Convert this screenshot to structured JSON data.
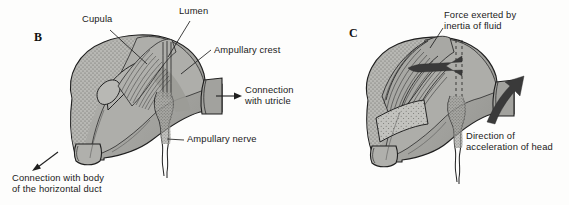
{
  "figure": {
    "background_color": "#fdfdfc",
    "ink_color": "#1a1a1a",
    "tissue_fill": "#a8a8a4",
    "tissue_fill_light": "#bdbdb9",
    "tissue_fill_dark": "#8f8f8b",
    "arrow_color": "#3a3a3a"
  },
  "panels": [
    {
      "id": "B",
      "letter": "B",
      "letter_pos": {
        "x": 36,
        "y": 35
      },
      "labels": [
        {
          "name": "cupula",
          "text": "Cupula",
          "x": 82,
          "y": 17,
          "lines": [
            "Cupula"
          ],
          "leader": {
            "x1": 108,
            "y1": 30,
            "x2": 146,
            "y2": 63
          }
        },
        {
          "name": "lumen",
          "text": "Lumen",
          "x": 180,
          "y": 8,
          "lines": [
            "Lumen"
          ],
          "leader": {
            "x1": 188,
            "y1": 21,
            "x2": 168,
            "y2": 58
          }
        },
        {
          "name": "ampullary-crest",
          "text": "Ampullary crest",
          "x": 213,
          "y": 44,
          "lines": [
            "Ampullary crest"
          ],
          "leader": {
            "x1": 211,
            "y1": 50,
            "x2": 180,
            "y2": 75
          }
        },
        {
          "name": "connection-with-utricle",
          "text": "Connection\nwith utricle",
          "x": 244,
          "y": 84,
          "lines": [
            "Connection",
            "with utricle"
          ],
          "arrow": {
            "x1": 216,
            "y1": 96,
            "x2": 240,
            "y2": 96
          }
        },
        {
          "name": "ampullary-nerve",
          "text": "Ampullary nerve",
          "x": 185,
          "y": 136,
          "lines": [
            "Ampullary nerve"
          ],
          "leader": {
            "x1": 183,
            "y1": 141,
            "x2": 166,
            "y2": 139
          }
        },
        {
          "name": "connection-with-body-of-horizontal-duct",
          "text": "Connection with body\nof the horizontal duct",
          "x": 14,
          "y": 173,
          "lines": [
            "Connection with body",
            "of the horizontal duct"
          ],
          "arrow": {
            "x1": 58,
            "y1": 152,
            "x2": 32,
            "y2": 172
          }
        }
      ]
    },
    {
      "id": "C",
      "letter": "C",
      "letter_pos": {
        "x": 351,
        "y": 31
      },
      "labels": [
        {
          "name": "force-exerted-by-inertia-of-fluid",
          "text": "Force exerted by\ninertia of fluid",
          "x": 444,
          "y": 12,
          "lines": [
            "Force exerted by",
            "inertia of fluid"
          ],
          "leader": {
            "x1": 441,
            "y1": 29,
            "x2": 428,
            "y2": 48
          }
        },
        {
          "name": "direction-of-acceleration-of-head",
          "text": "Direction of\nacceleration of head",
          "x": 466,
          "y": 131,
          "lines": [
            "Direction of",
            "acceleration of head"
          ],
          "curved_arrow": true
        }
      ]
    }
  ]
}
